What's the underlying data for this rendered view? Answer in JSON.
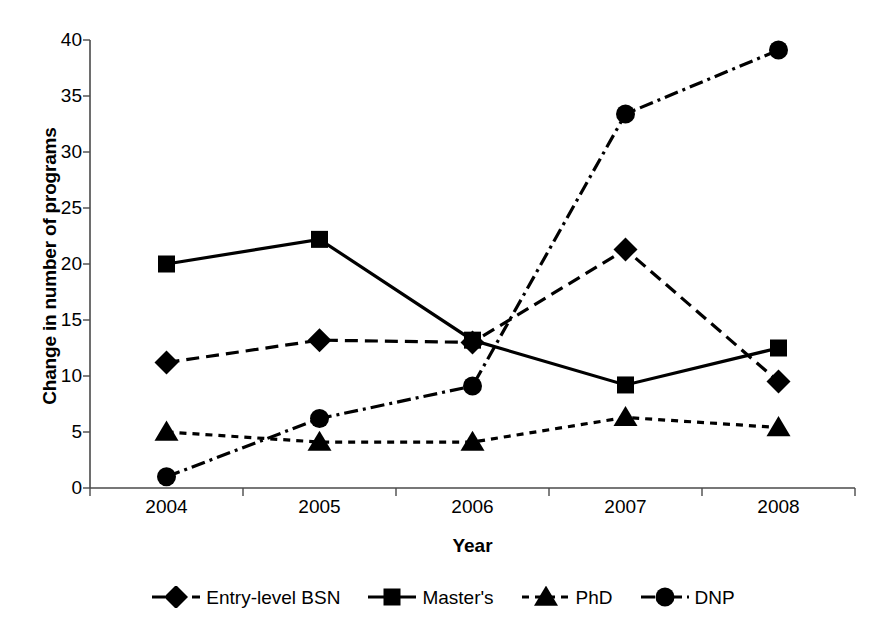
{
  "chart_data": {
    "type": "line",
    "title": "",
    "xlabel": "Year",
    "ylabel": "Change in number of programs",
    "categories": [
      "2004",
      "2005",
      "2006",
      "2007",
      "2008"
    ],
    "x_tick_labels": [
      "2004",
      "2005",
      "2006",
      "2007",
      "2008"
    ],
    "y_tick_labels": [
      "0",
      "5",
      "10",
      "15",
      "20",
      "25",
      "30",
      "35",
      "40"
    ],
    "y_ticks": [
      0,
      5,
      10,
      15,
      20,
      25,
      30,
      35,
      40
    ],
    "ylim": [
      0,
      40
    ],
    "grid": false,
    "legend_position": "bottom",
    "series": [
      {
        "name": "Entry-level BSN",
        "marker": "diamond",
        "linestyle": "dashed",
        "color": "#000000",
        "values": [
          11.2,
          13.2,
          13.0,
          21.3,
          9.5
        ]
      },
      {
        "name": "Master's",
        "marker": "square",
        "linestyle": "solid",
        "color": "#000000",
        "values": [
          20.0,
          22.2,
          13.2,
          9.2,
          12.5
        ]
      },
      {
        "name": "PhD",
        "marker": "triangle",
        "linestyle": "dotted",
        "color": "#000000",
        "values": [
          5.0,
          4.1,
          4.1,
          6.3,
          5.4
        ]
      },
      {
        "name": "DNP",
        "marker": "circle",
        "linestyle": "dashdot",
        "color": "#000000",
        "values": [
          1.0,
          6.2,
          9.1,
          33.4,
          39.1
        ]
      }
    ]
  },
  "axes": {
    "y_title": "Change in number of programs",
    "x_title": "Year"
  },
  "legend": {
    "items": [
      {
        "label": "Entry-level BSN"
      },
      {
        "label": "Master's"
      },
      {
        "label": "PhD"
      },
      {
        "label": "DNP"
      }
    ]
  },
  "colors": {
    "ink": "#000000",
    "axis": "#4a4a4a",
    "background": "#ffffff"
  }
}
